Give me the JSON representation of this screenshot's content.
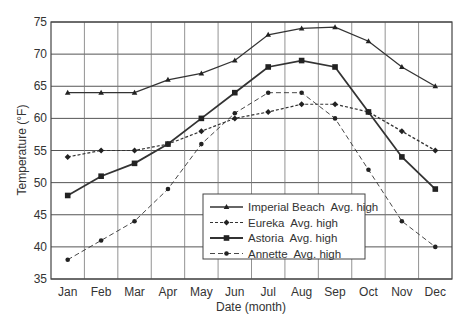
{
  "chart_data": {
    "type": "line",
    "title": "",
    "xlabel": "Date (month)",
    "ylabel": "Temperature (°F)",
    "categories": [
      "Jan",
      "Feb",
      "Mar",
      "Apr",
      "May",
      "Jun",
      "Jul",
      "Aug",
      "Sep",
      "Oct",
      "Nov",
      "Dec"
    ],
    "ylim": [
      35,
      75
    ],
    "yticks": [
      35,
      40,
      45,
      50,
      55,
      60,
      65,
      70,
      75
    ],
    "grid": true,
    "legend_position": "lower-center-right inside plot",
    "series": [
      {
        "name": "Imperial Beach  Avg. high",
        "marker": "triangle",
        "line": "solid",
        "values": [
          64,
          64,
          64,
          66,
          67,
          69,
          73,
          74,
          74.2,
          72,
          68,
          65
        ]
      },
      {
        "name": "Eureka  Avg. high",
        "marker": "diamond",
        "line": "dotted",
        "values": [
          54,
          55,
          55,
          56,
          58,
          60,
          61,
          62.2,
          62.2,
          61,
          58,
          55
        ]
      },
      {
        "name": "Astoria  Avg. high",
        "marker": "square",
        "line": "solid-thick",
        "values": [
          48,
          51,
          53,
          56,
          60,
          64,
          68,
          69,
          68,
          61,
          54,
          49
        ]
      },
      {
        "name": "Annette  Avg. high",
        "marker": "circle",
        "line": "dashed",
        "values": [
          38,
          41,
          44,
          49,
          56,
          60.8,
          64,
          64,
          60,
          52,
          44,
          40
        ]
      }
    ]
  },
  "colors": {
    "line": "#333333",
    "grid": "#555555",
    "background": "#ffffff"
  }
}
